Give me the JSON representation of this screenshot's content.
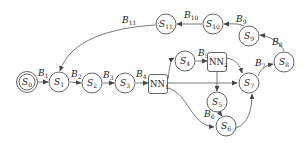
{
  "diagram": {
    "nodes": [
      {
        "id": "S0",
        "label": "S",
        "sub": "0",
        "type": "start",
        "x": 27,
        "y": 82
      },
      {
        "id": "S1",
        "label": "S",
        "sub": "1",
        "x": 59,
        "y": 82
      },
      {
        "id": "S2",
        "label": "S",
        "sub": "2",
        "x": 92,
        "y": 83
      },
      {
        "id": "S3",
        "label": "S",
        "sub": "3",
        "x": 125,
        "y": 83
      },
      {
        "id": "NN1",
        "label": "NN",
        "sub": "1",
        "type": "box",
        "x": 158,
        "y": 84
      },
      {
        "id": "S4",
        "label": "S",
        "sub": "4",
        "x": 185,
        "y": 61
      },
      {
        "id": "NN2",
        "label": "NN",
        "sub": "2",
        "type": "box",
        "x": 217,
        "y": 62
      },
      {
        "id": "S5",
        "label": "S",
        "sub": "5",
        "x": 217,
        "y": 102
      },
      {
        "id": "S6",
        "label": "S",
        "sub": "6",
        "x": 226,
        "y": 126
      },
      {
        "id": "S7",
        "label": "S",
        "sub": "7",
        "x": 249,
        "y": 83
      },
      {
        "id": "S8",
        "label": "S",
        "sub": "8",
        "x": 284,
        "y": 62
      },
      {
        "id": "S9",
        "label": "S",
        "sub": "9",
        "x": 249,
        "y": 36
      },
      {
        "id": "S10",
        "label": "S",
        "sub": "10",
        "x": 213,
        "y": 24
      },
      {
        "id": "S11",
        "label": "S",
        "sub": "11",
        "x": 166,
        "y": 24
      }
    ],
    "edge_labels": {
      "B1": {
        "t": "B",
        "s": "1"
      },
      "B2": {
        "t": "B",
        "s": "2"
      },
      "B3": {
        "t": "B",
        "s": "3"
      },
      "B4": {
        "t": "B",
        "s": "4"
      },
      "B5": {
        "t": "B",
        "s": "5"
      },
      "B6": {
        "t": "B",
        "s": "6"
      },
      "B7": {
        "t": "B",
        "s": "7"
      },
      "B8": {
        "t": "B",
        "s": "8"
      },
      "B9": {
        "t": "B",
        "s": "9"
      },
      "B10": {
        "t": "B",
        "s": "10"
      },
      "B11": {
        "t": "B",
        "s": "11"
      }
    },
    "edges": [
      {
        "from": "S0",
        "to": "S1",
        "label": "B1"
      },
      {
        "from": "S1",
        "to": "S2",
        "label": "B2"
      },
      {
        "from": "S2",
        "to": "S3",
        "label": "B3"
      },
      {
        "from": "S3",
        "to": "NN1",
        "label": "B4"
      },
      {
        "from": "NN1",
        "to": "S4"
      },
      {
        "from": "S4",
        "to": "NN2",
        "label": "B5"
      },
      {
        "from": "NN1",
        "to": "S7"
      },
      {
        "from": "NN1",
        "to": "S6"
      },
      {
        "from": "NN2",
        "to": "S7"
      },
      {
        "from": "NN2",
        "to": "S5"
      },
      {
        "from": "S5",
        "to": "S6",
        "label": "B6"
      },
      {
        "from": "S6",
        "to": "S7"
      },
      {
        "from": "S7",
        "to": "S8",
        "label": "B7"
      },
      {
        "from": "S8",
        "to": "S9",
        "label": "B8"
      },
      {
        "from": "S9",
        "to": "S10",
        "label": "B9"
      },
      {
        "from": "S10",
        "to": "S11",
        "label": "B10"
      },
      {
        "from": "S11",
        "to": "S1",
        "label": "B11"
      }
    ]
  }
}
